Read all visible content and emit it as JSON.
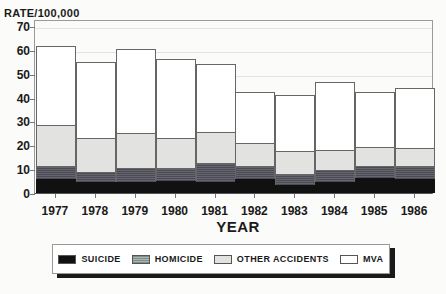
{
  "chart_data": {
    "type": "bar",
    "stacked": true,
    "title": "",
    "ylabel": "RATE/100,000",
    "xlabel": "YEAR",
    "ylim": [
      0,
      70
    ],
    "yticks": [
      0,
      10,
      20,
      30,
      40,
      50,
      60,
      70
    ],
    "grid": true,
    "legend_position": "bottom",
    "categories": [
      "1977",
      "1978",
      "1979",
      "1980",
      "1981",
      "1982",
      "1983",
      "1984",
      "1985",
      "1986"
    ],
    "series": [
      {
        "name": "SUICIDE",
        "color": "#111111",
        "values": [
          6.0,
          4.5,
          4.5,
          5.0,
          4.5,
          6.0,
          3.5,
          4.5,
          6.5,
          6.0
        ]
      },
      {
        "name": "HOMICIDE",
        "color": "#9a9aaa",
        "values": [
          5.5,
          4.5,
          6.0,
          5.5,
          8.0,
          5.5,
          4.5,
          5.0,
          5.0,
          5.5
        ]
      },
      {
        "name": "OTHER ACCIDENTS",
        "color": "#e2e2e0",
        "values": [
          17.0,
          14.0,
          14.5,
          12.5,
          13.0,
          9.5,
          9.5,
          8.5,
          8.0,
          7.5
        ]
      },
      {
        "name": "MVA",
        "color": "#ffffff",
        "values": [
          33.0,
          32.0,
          35.5,
          33.0,
          28.5,
          21.5,
          23.5,
          28.5,
          23.0,
          25.0
        ]
      }
    ],
    "totals": [
      61.5,
      55.0,
      60.5,
      56.0,
      54.0,
      42.5,
      41.0,
      46.5,
      42.5,
      44.0
    ]
  }
}
